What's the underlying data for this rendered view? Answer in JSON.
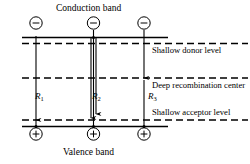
{
  "figure": {
    "title_top": "Conduction band",
    "title_bottom": "Valence band",
    "width": 250,
    "height": 164,
    "background": "#ffffff",
    "ink": "#000000"
  },
  "levels": [
    {
      "id": "conduction-band",
      "label": "Conduction band",
      "style": "solid",
      "y": 37
    },
    {
      "id": "shallow-donor-level",
      "label": "Shallow donor level",
      "style": "dashed",
      "y": 43
    },
    {
      "id": "deep-recombination-center",
      "label": "Deep recombination center",
      "style": "dashed",
      "y": 78
    },
    {
      "id": "shallow-acceptor-level",
      "label": "Shallow acceptor level",
      "style": "dashed",
      "y": 120
    },
    {
      "id": "valence-band",
      "label": "Valence band",
      "style": "solid",
      "y": 126
    }
  ],
  "annotations": {
    "donor": "Shallow donor level",
    "deep": "Deep recombination center",
    "acceptor": "Shallow acceptor level"
  },
  "transitions": [
    {
      "id": "R1",
      "label": "R",
      "sub": "1",
      "x": 36,
      "kind": "band-to-band"
    },
    {
      "id": "R2",
      "label": "R",
      "sub": "2",
      "x": 93,
      "kind": "double-band-to-band"
    },
    {
      "id": "R3",
      "label": "R",
      "sub": "3",
      "x": 144,
      "kind": "via-deep-center"
    }
  ],
  "carriers": {
    "electron_symbol": "−",
    "hole_symbol": "+",
    "electrons": [
      {
        "x": 36,
        "y": 23
      },
      {
        "x": 93,
        "y": 23
      },
      {
        "x": 144,
        "y": 23
      }
    ],
    "holes": [
      {
        "x": 36,
        "y": 134
      },
      {
        "x": 93,
        "y": 134
      },
      {
        "x": 144,
        "y": 134
      }
    ]
  }
}
